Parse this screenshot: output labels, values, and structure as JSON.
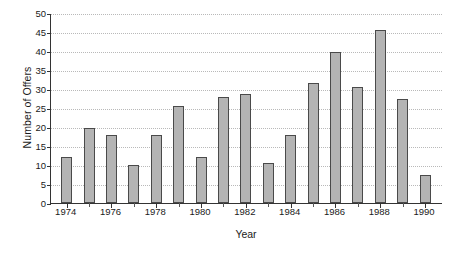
{
  "chart_data": {
    "type": "bar",
    "title": "",
    "xlabel": "Year",
    "ylabel": "Number of Offers",
    "categories": [
      1974,
      1975,
      1976,
      1977,
      1978,
      1979,
      1980,
      1981,
      1982,
      1983,
      1984,
      1985,
      1986,
      1987,
      1988,
      1989,
      1990
    ],
    "values": [
      12,
      19.8,
      18,
      9.9,
      18,
      25.6,
      12,
      28,
      28.8,
      10.5,
      17.8,
      31.5,
      39.7,
      30.6,
      45.5,
      27.5,
      7.5
    ],
    "xlim": [
      1973.3,
      1990.8
    ],
    "ylim": [
      0,
      50
    ],
    "yticks": [
      0,
      5,
      10,
      15,
      20,
      25,
      30,
      35,
      40,
      45,
      50
    ],
    "ytick_labels": [
      "0",
      "5",
      "10",
      "15",
      "20",
      "25",
      "30",
      "35",
      "40",
      "45",
      "50"
    ],
    "xticks": [
      1974,
      1976,
      1978,
      1980,
      1982,
      1984,
      1986,
      1988,
      1990
    ],
    "xtick_labels": [
      "1974",
      "1976",
      "1978",
      "1980",
      "1982",
      "1984",
      "1986",
      "1988",
      "1990"
    ],
    "xminor_ticks": [
      1975,
      1977,
      1979,
      1981,
      1983,
      1985,
      1987,
      1989
    ],
    "grid": "horizontal-dotted",
    "legend": "none",
    "bar_color": "#b4b4b4",
    "bar_edge_color": "#4a4a4a",
    "axis_color": "#333333",
    "grid_color": "#b9b9b9"
  }
}
